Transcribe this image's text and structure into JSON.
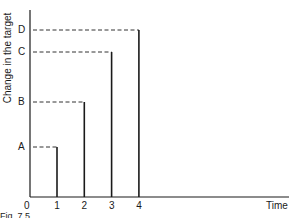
{
  "chart_data": {
    "type": "line",
    "title": "",
    "caption": "Fig. 7.5",
    "xlabel": "Time",
    "ylabel": "Change in the target",
    "x_ticks": [
      "0",
      "1",
      "2",
      "3",
      "4"
    ],
    "y_ticks": [
      "A",
      "B",
      "C",
      "D"
    ],
    "grid": false,
    "legend": null,
    "series": [
      {
        "name": "A",
        "x": 1,
        "y": 50
      },
      {
        "name": "B",
        "x": 2,
        "y": 95
      },
      {
        "name": "C",
        "x": 3,
        "y": 145
      },
      {
        "name": "D",
        "x": 4,
        "y": 167
      }
    ],
    "xlim": [
      0,
      9.2
    ],
    "ylim": [
      0,
      187
    ],
    "note": "Each target level shown as a vertical line at its time point with a dashed horizontal line back to the y-axis label"
  },
  "colors": {
    "line": "#1a1a1a",
    "dash": "#333333",
    "background": "#ffffff"
  }
}
